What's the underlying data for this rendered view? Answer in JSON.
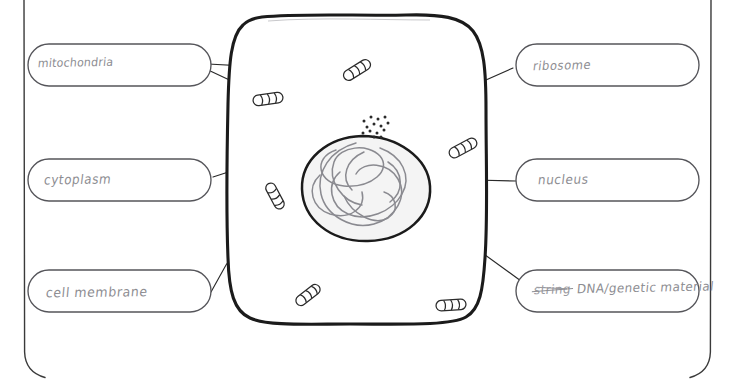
{
  "page": {
    "background_color": "#ffffff",
    "ink_color": "#8d8d92",
    "outline_color": "#1b1b1b",
    "width": 749,
    "height": 379
  },
  "diagram": {
    "name": "animal-cell",
    "cell_fill": "#ffffff",
    "nucleus_fill": "#f4f4f4",
    "organelles": {
      "mitochondria_count": 6,
      "ribosome_dot_count": 14,
      "dna_strand_count": 7
    }
  },
  "labels": [
    {
      "id": "mitochondria",
      "text": "mitochondria",
      "side": "left",
      "row": 1
    },
    {
      "id": "cytoplasm",
      "text": "cytoplasm",
      "side": "left",
      "row": 2
    },
    {
      "id": "cell-membrane",
      "text": "cell membrane",
      "side": "left",
      "row": 3
    },
    {
      "id": "ribosome",
      "text": "ribosome",
      "side": "right",
      "row": 1
    },
    {
      "id": "nucleus",
      "text": "nucleus",
      "side": "right",
      "row": 2
    },
    {
      "id": "dna",
      "text": "DNA/genetic material",
      "struck_text": "string",
      "side": "right",
      "row": 3
    }
  ],
  "label_text": {
    "mitochondria": "mitochondria",
    "cytoplasm": "cytoplasm",
    "cell_membrane": "cell membrane",
    "ribosome": "ribosome",
    "nucleus": "nucleus",
    "dna_struck": "string",
    "dna_main": "DNA/genetic material"
  }
}
